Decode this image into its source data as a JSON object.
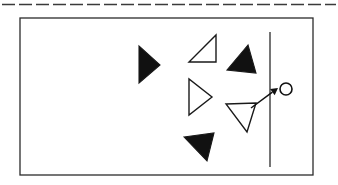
{
  "figure": {
    "background_color": "#ffffff",
    "stroke_color": "#1a1a1a",
    "fill_black": "#111111",
    "fill_white": "#ffffff",
    "canvas": {
      "width": 338,
      "height": 185
    }
  },
  "elements": {
    "dashed_line": {
      "label": "dashed-boundary-line",
      "x1": 2,
      "y1": 4.5,
      "x2": 336,
      "y2": 4.5,
      "stroke_width": 1.6,
      "dash_pattern": "13 4",
      "color": "#3a3a3a"
    },
    "border_box": {
      "label": "outer-rectangle",
      "x": 20,
      "y": 18,
      "width": 293,
      "height": 157,
      "stroke_width": 1.3,
      "fill": "none",
      "color": "#2b2b2b"
    },
    "vertical_line": {
      "label": "vertical-divider-line",
      "x1": 270,
      "y1": 32,
      "x2": 270,
      "y2": 167,
      "stroke_width": 1.3,
      "color": "#2b2b2b"
    },
    "circle_target": {
      "label": "target-circle",
      "cx": 286,
      "cy": 89,
      "r": 6,
      "stroke_width": 1.6,
      "fill": "#ffffff",
      "color": "#111111"
    },
    "arrow": {
      "label": "direction-arrow",
      "tail_x": 251,
      "tail_y": 108,
      "head_x": 278,
      "head_y": 88,
      "stroke_width": 1.5,
      "head_size": 7,
      "color": "#111111"
    }
  },
  "triangles": [
    {
      "id": "black-triangle-left",
      "fill": "black",
      "orientation": "pointing-right",
      "points": "139,46 139,83 160,65"
    },
    {
      "id": "white-triangle-upper",
      "fill": "white",
      "orientation": "right-angle-lower-left",
      "points": "189,62 216,62 216,35"
    },
    {
      "id": "black-triangle-upper-right",
      "fill": "black",
      "orientation": "pointing-left",
      "points": "248,45 227,70 256,73"
    },
    {
      "id": "white-triangle-middle",
      "fill": "white",
      "orientation": "pointing-right",
      "points": "189,79 189,115 212,97"
    },
    {
      "id": "white-triangle-lower-right",
      "fill": "white",
      "orientation": "pointing-down",
      "points": "226,104 256,103 247,132"
    },
    {
      "id": "black-triangle-bottom",
      "fill": "black",
      "orientation": "pointing-down-right",
      "points": "184,137 214,133 207,161"
    }
  ]
}
